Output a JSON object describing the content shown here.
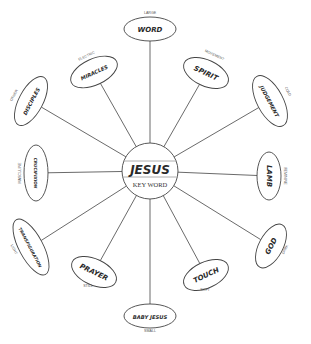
{
  "diagram": {
    "center": {
      "title": "JESUS",
      "subtitle": "KEY WORD",
      "cx": 150,
      "cy": 171,
      "r": 28
    },
    "colors": {
      "stroke": "#444444",
      "text": "#2a2a2a",
      "label": "#555555",
      "background": "#ffffff"
    },
    "nodes": [
      {
        "word": "WORD",
        "quality": "LARGE",
        "cx": 150,
        "cy": 29,
        "rx": 26,
        "ry": 12,
        "rot": 0,
        "lx": 150,
        "ly": 14,
        "lrot": 0
      },
      {
        "word": "SPIRIT",
        "quality": "MOVEMENT",
        "cx": 206,
        "cy": 73,
        "rx": 24,
        "ry": 13,
        "rot": 25,
        "lx": 214,
        "ly": 56,
        "lrot": 25
      },
      {
        "word": "JUDGEMENT",
        "quality": "COLD",
        "cx": 270,
        "cy": 101,
        "rx": 28,
        "ry": 13,
        "rot": 62,
        "lx": 287,
        "ly": 92,
        "lrot": 62
      },
      {
        "word": "LAMB",
        "quality": "FEMININE",
        "cx": 269,
        "cy": 176,
        "rx": 24,
        "ry": 12,
        "rot": 90,
        "lx": 284,
        "ly": 176,
        "lrot": 90
      },
      {
        "word": "GOD",
        "quality": "DARK",
        "cx": 271,
        "cy": 246,
        "rx": 24,
        "ry": 12,
        "rot": -62,
        "lx": 286,
        "ly": 250,
        "lrot": -62
      },
      {
        "word": "TOUCH",
        "quality": "SOFT",
        "cx": 206,
        "cy": 275,
        "rx": 24,
        "ry": 13,
        "rot": -25,
        "lx": 205,
        "ly": 291,
        "lrot": 0
      },
      {
        "word": "BABY JESUS",
        "quality": "SMALL",
        "cx": 150,
        "cy": 316,
        "rx": 26,
        "ry": 12,
        "rot": 0,
        "lx": 150,
        "ly": 332,
        "lrot": 0
      },
      {
        "word": "PRAYER",
        "quality": "STILL",
        "cx": 94,
        "cy": 272,
        "rx": 24,
        "ry": 13,
        "rot": 25,
        "lx": 88,
        "ly": 287,
        "lrot": 0
      },
      {
        "word": "TRANSFIGURATION",
        "quality": "LIGHT",
        "cx": 31,
        "cy": 247,
        "rx": 31,
        "ry": 12,
        "rot": 62,
        "lx": 13,
        "ly": 250,
        "lrot": 62
      },
      {
        "word": "CRUCIFIXION",
        "quality": "MASCULINE",
        "cx": 36,
        "cy": 173,
        "rx": 28,
        "ry": 12,
        "rot": 90,
        "lx": 21,
        "ly": 173,
        "lrot": -90
      },
      {
        "word": "DISCIPLES",
        "quality": "OTHER",
        "cx": 31,
        "cy": 101,
        "rx": 27,
        "ry": 12,
        "rot": -62,
        "lx": 15,
        "ly": 96,
        "lrot": -62
      },
      {
        "word": "MIRACLES",
        "quality": "ELECTRIC",
        "cx": 94,
        "cy": 72,
        "rx": 25,
        "ry": 13,
        "rot": -25,
        "lx": 87,
        "ly": 57,
        "lrot": -25
      }
    ]
  }
}
